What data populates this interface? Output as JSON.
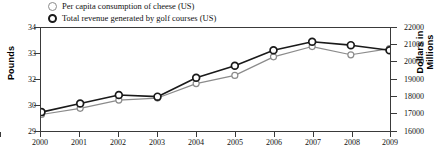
{
  "legend": {
    "items": [
      {
        "label": "Per capita consumption of cheese (US)",
        "marker": "open-circle-icon",
        "color": "#8b8b8b",
        "style": "thin"
      },
      {
        "label": "Total revenue generated by golf courses (US)",
        "marker": "open-circle-icon",
        "color": "#1a1a1a",
        "style": "thick"
      }
    ]
  },
  "axes": {
    "left": {
      "title": "Pounds",
      "ticks": [
        "34",
        "33",
        "32",
        "30",
        "29"
      ]
    },
    "right": {
      "title": "Dollars in Millions",
      "ticks": [
        "22000",
        "21000",
        "20000",
        "19000",
        "18000",
        "17000",
        "16000"
      ]
    },
    "bottom": {
      "ticks": [
        "2000",
        "2001",
        "2002",
        "2003",
        "2004",
        "2005",
        "2006",
        "2007",
        "2008",
        "2009"
      ]
    }
  },
  "chart_data": {
    "type": "line",
    "title": "",
    "xlabel": "",
    "ylabel": "Pounds",
    "y2label": "Dollars in Millions",
    "x": [
      2000,
      2001,
      2002,
      2003,
      2004,
      2005,
      2006,
      2007,
      2008,
      2009
    ],
    "categories": [
      "2000",
      "2001",
      "2002",
      "2003",
      "2004",
      "2005",
      "2006",
      "2007",
      "2008",
      "2009"
    ],
    "grid": false,
    "legend_position": "top-left",
    "ylim": [
      29,
      34
    ],
    "y2lim": [
      16000,
      22000
    ],
    "series": [
      {
        "name": "Per capita consumption of cheese (US)",
        "axis": "left",
        "units": "Pounds",
        "color": "#8b8b8b",
        "marker": "open-circle",
        "values": [
          29.8,
          30.1,
          30.5,
          30.6,
          31.3,
          31.7,
          32.6,
          33.1,
          32.7,
          33.0
        ]
      },
      {
        "name": "Total revenue generated by golf courses (US)",
        "axis": "right",
        "units": "Dollars in Millions",
        "color": "#1a1a1a",
        "marker": "open-circle",
        "values": [
          17100,
          17600,
          18100,
          18000,
          19100,
          19800,
          20700,
          21200,
          21000,
          20700
        ]
      }
    ]
  }
}
